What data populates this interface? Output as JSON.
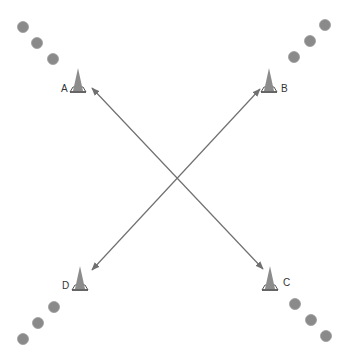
{
  "diagram": {
    "type": "drill-layout",
    "colors": {
      "line": "#707070",
      "ball": "#8a8a8a",
      "ball_stroke": "#9a9a9a",
      "cone": "#8c8c8c",
      "cone_base": "#555555"
    },
    "cones": [
      {
        "label": "A",
        "x": 78,
        "y": 80,
        "label_x": 61,
        "label_y": 92
      },
      {
        "label": "B",
        "x": 269,
        "y": 80,
        "label_x": 281,
        "label_y": 92
      },
      {
        "label": "C",
        "x": 270,
        "y": 278,
        "label_x": 283,
        "label_y": 286
      },
      {
        "label": "D",
        "x": 80,
        "y": 278,
        "label_x": 62,
        "label_y": 289
      }
    ],
    "balls": [
      {
        "x": 23,
        "y": 27
      },
      {
        "x": 37,
        "y": 43
      },
      {
        "x": 53,
        "y": 59
      },
      {
        "x": 325,
        "y": 25
      },
      {
        "x": 310,
        "y": 41
      },
      {
        "x": 294,
        "y": 57
      },
      {
        "x": 54,
        "y": 307
      },
      {
        "x": 38,
        "y": 323
      },
      {
        "x": 23,
        "y": 339
      },
      {
        "x": 295,
        "y": 304
      },
      {
        "x": 311,
        "y": 320
      },
      {
        "x": 326,
        "y": 336
      }
    ],
    "arrows": [
      {
        "from": "A",
        "to": "C",
        "x1": 92,
        "y1": 88,
        "x2": 263,
        "y2": 269,
        "double": true
      },
      {
        "from": "B",
        "to": "D",
        "x1": 260,
        "y1": 89,
        "x2": 92,
        "y2": 270,
        "double": true
      }
    ]
  }
}
